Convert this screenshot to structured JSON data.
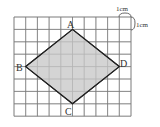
{
  "diagram": {
    "grid": {
      "columns": 10,
      "rows": 8,
      "origin_x": 14,
      "origin_y": 17,
      "cell_w": 11.7,
      "cell_h": 12.4,
      "line_color": "#777777"
    },
    "shape": {
      "fill": "#d4d4d4",
      "stroke": "#222222",
      "vertices": [
        {
          "name": "A",
          "col": 5,
          "row": 1
        },
        {
          "name": "D",
          "col": 9,
          "row": 4
        },
        {
          "name": "C",
          "col": 5,
          "row": 7
        },
        {
          "name": "B",
          "col": 1,
          "row": 4
        }
      ]
    },
    "labels": {
      "A": "A",
      "B": "B",
      "C": "C",
      "D": "D"
    },
    "scale": {
      "top": "1cm",
      "right": "1cm"
    }
  }
}
